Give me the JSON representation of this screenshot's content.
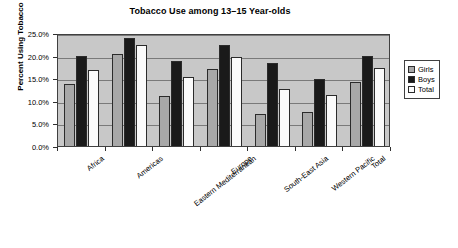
{
  "chart_data": {
    "type": "bar",
    "title": "Tobacco Use among 13–15 Year-olds",
    "xlabel": "WHO Region",
    "ylabel": "Percent Using Tobacco",
    "categories": [
      "Africa",
      "Americas",
      "Eastern Mediterranean",
      "Europe",
      "South-East Asia",
      "Western Pacific",
      "Total"
    ],
    "series": [
      {
        "name": "Girls",
        "color": "#a8a8a8",
        "values": [
          13.8,
          20.4,
          11.1,
          17.0,
          7.0,
          7.6,
          14.2
        ]
      },
      {
        "name": "Boys",
        "color": "#1a1a1a",
        "values": [
          19.9,
          24.0,
          18.8,
          22.3,
          18.3,
          14.8,
          20.0
        ]
      },
      {
        "name": "Total",
        "color": "#fbfbfb",
        "values": [
          16.8,
          22.3,
          15.2,
          19.8,
          12.7,
          11.2,
          17.2
        ]
      }
    ],
    "ylim": [
      0,
      25
    ],
    "ytick_values": [
      0,
      5,
      10,
      15,
      20,
      25
    ],
    "ytick_labels": [
      "0.0%",
      "5.0%",
      "10.0%",
      "15.0%",
      "20.0%",
      "25.0%"
    ],
    "grid": true,
    "grid_axis": "y",
    "legend_position": "right",
    "plot_background": "#c8c8c8"
  }
}
